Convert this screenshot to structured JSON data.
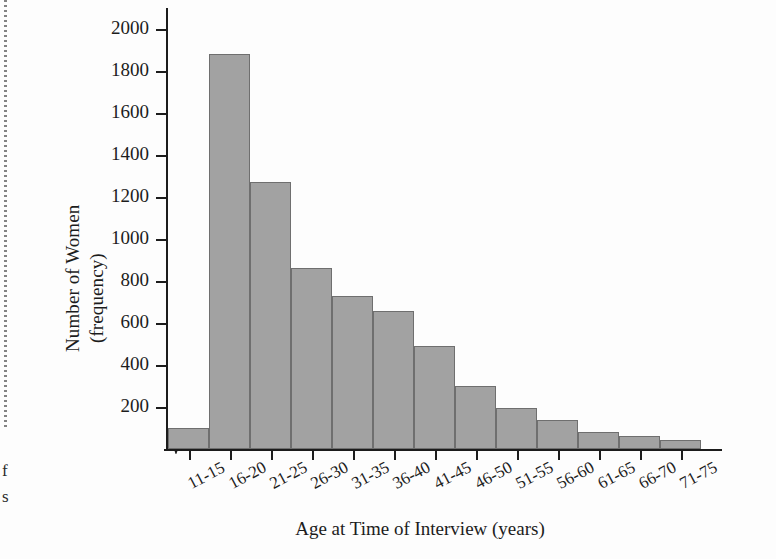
{
  "figure": {
    "background_color": "#fdfdfd",
    "bar_fill_color": "#a2a2a2",
    "bar_edge_color": "#6f6f6f",
    "axis_color": "#1c1c1c"
  },
  "margin_artifacts": {
    "glyph_top": "f",
    "glyph_bottom": "s"
  },
  "chart_data": {
    "type": "bar",
    "title": "",
    "xlabel": "Age at Time of Interview (years)",
    "ylabel_line1": "Number of Women",
    "ylabel_line2": "(frequency)",
    "categories": [
      "11-15",
      "16-20",
      "21-25",
      "26-30",
      "31-35",
      "36-40",
      "41-45",
      "46-50",
      "51-55",
      "56-60",
      "61-65",
      "66-70",
      "71-75"
    ],
    "values": [
      100,
      1880,
      1270,
      860,
      730,
      655,
      490,
      300,
      195,
      140,
      80,
      60,
      45
    ],
    "ylim": [
      0,
      2100
    ],
    "yticks": [
      200,
      400,
      600,
      800,
      1000,
      1200,
      1400,
      1600,
      1800,
      2000
    ],
    "ytick_labels": [
      "200",
      "400",
      "600",
      "800",
      "1000",
      "1200",
      "1400",
      "1600",
      "1800",
      "2000"
    ],
    "grid": false,
    "legend": false,
    "axis_break_at_origin": true
  }
}
